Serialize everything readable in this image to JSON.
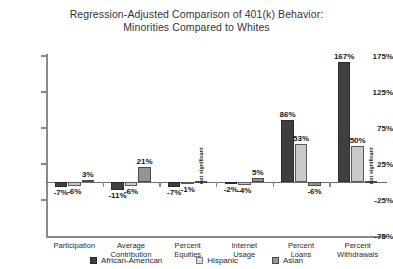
{
  "chart_data": {
    "type": "bar",
    "title": "Regression-Adjusted Comparison of 401(k) Behavior: Minorities Compared to Whites",
    "title_lines": [
      "Regression-Adjusted Comparison of 401(k) Behavior:",
      "Minorities Compared to Whites"
    ],
    "xlabel": "",
    "ylabel": "",
    "ylim": [
      -75,
      175
    ],
    "yticks": [
      175,
      125,
      75,
      25,
      -25,
      -75
    ],
    "ytick_labels": [
      "175%",
      "125%",
      "75%",
      "25%",
      "-25%",
      "-75%"
    ],
    "grid": false,
    "legend_position": "bottom",
    "categories": [
      "Participation",
      "Average Contribution",
      "Percent Equities",
      "Internet Usage",
      "Percent Loans",
      "Percent Withdrawals"
    ],
    "category_lines": [
      [
        "Participation"
      ],
      [
        "Average",
        "Contribution"
      ],
      [
        "Percent",
        "Equities"
      ],
      [
        "Internet",
        "Usage"
      ],
      [
        "Percent",
        "Loans"
      ],
      [
        "Percent",
        "Withdrawals"
      ]
    ],
    "series": [
      {
        "name": "African-American",
        "color": "#3f3f3f",
        "values": [
          -7,
          -11,
          -7,
          -2,
          86,
          167
        ],
        "labels": [
          "-7%",
          "-11%",
          "-7%",
          "-2%",
          "86%",
          "167%"
        ],
        "not_significant": [
          false,
          false,
          false,
          false,
          false,
          false
        ]
      },
      {
        "name": "Hispanic",
        "color": "#c9c9c9",
        "values": [
          -6,
          -6,
          -1,
          -4,
          53,
          50
        ],
        "labels": [
          "-6%",
          "-6%",
          "-1%",
          "-4%",
          "53%",
          "50%"
        ],
        "not_significant": [
          false,
          false,
          false,
          false,
          false,
          false
        ]
      },
      {
        "name": "Asian",
        "color": "#949494",
        "values": [
          3,
          21,
          null,
          5,
          -6,
          null
        ],
        "labels": [
          "3%",
          "21%",
          "",
          "5%",
          "-6%",
          ""
        ],
        "not_significant": [
          false,
          false,
          true,
          false,
          false,
          true
        ]
      }
    ],
    "not_significant_label": "not significant"
  },
  "legend": {
    "items": [
      {
        "label": "African-American"
      },
      {
        "label": "Hispanic"
      },
      {
        "label": "Asian"
      }
    ]
  }
}
